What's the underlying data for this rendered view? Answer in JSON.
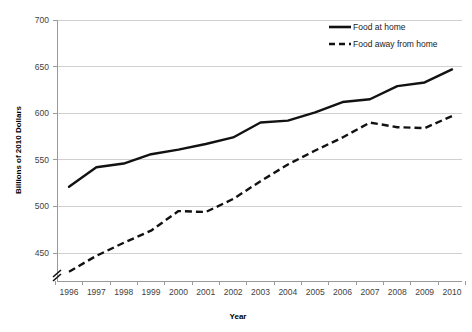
{
  "chart_data": {
    "type": "line",
    "title": "",
    "xlabel": "Year",
    "ylabel": "Billions of 2010 Dollars",
    "x": [
      1996,
      1997,
      1998,
      1999,
      2000,
      2001,
      2002,
      2003,
      2004,
      2005,
      2006,
      2007,
      2008,
      2009,
      2010
    ],
    "categories": [
      "1996",
      "1997",
      "1998",
      "1999",
      "2000",
      "2001",
      "2002",
      "2003",
      "2004",
      "2005",
      "2006",
      "2007",
      "2008",
      "2009",
      "2010"
    ],
    "series": [
      {
        "name": "Food at home",
        "style": "solid",
        "values": [
          521,
          542,
          546,
          556,
          561,
          567,
          574,
          590,
          592,
          601,
          612,
          615,
          629,
          633,
          647
        ]
      },
      {
        "name": "Food away from home",
        "style": "dashed",
        "values": [
          430,
          447,
          461,
          474,
          495,
          494,
          508,
          527,
          545,
          560,
          574,
          590,
          585,
          584,
          597
        ]
      }
    ],
    "ylim": [
      420,
      700
    ],
    "ytick_values": [
      450,
      500,
      550,
      600,
      650,
      700
    ],
    "ytick_labels": [
      "450",
      "500",
      "550",
      "600",
      "650",
      "700"
    ],
    "xtick_labels": [
      "1996",
      "1997",
      "1998",
      "1999",
      "2000",
      "2001",
      "2002",
      "2003",
      "2004",
      "2005",
      "2006",
      "2007",
      "2008",
      "2009",
      "2010"
    ],
    "grid": true,
    "grid_axis": "y",
    "legend_position": "top-right",
    "axis_break": true,
    "legend": [
      "Food at home",
      "Food away from home"
    ],
    "colors": {
      "line": "#121212",
      "grid": "#d0d0d0",
      "axis": "#9a9a9a",
      "tick_text": "#3f3f3f",
      "title_text": "#000000",
      "background": "#ffffff"
    }
  }
}
